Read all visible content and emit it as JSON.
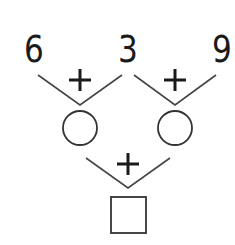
{
  "numbers": [
    "6",
    "3",
    "9"
  ],
  "operators": {
    "top_left": "+",
    "top_right": "+",
    "bottom": "+"
  },
  "shapes": {
    "blank_circles": 2,
    "blank_square": 1
  },
  "colors": {
    "stroke": "#333333",
    "text": "#1a1a1a"
  }
}
